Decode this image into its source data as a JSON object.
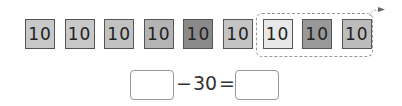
{
  "tiles": [
    {
      "label": "10",
      "color": "#c8c8c8"
    },
    {
      "label": "10",
      "color": "#c8c8c8"
    },
    {
      "label": "10",
      "color": "#c2c2c2"
    },
    {
      "label": "10",
      "color": "#b4b4b4"
    },
    {
      "label": "10",
      "color": "#8a8a8a"
    },
    {
      "label": "10",
      "color": "#c4c4c4"
    },
    {
      "label": "10",
      "color": "#e8e8e8"
    },
    {
      "label": "10",
      "color": "#999999"
    },
    {
      "label": "10",
      "color": "#bcbcbc"
    }
  ],
  "equation": {
    "left_blank": "",
    "operator": "−",
    "subtrahend": "30",
    "equals": "=",
    "right_blank": ""
  }
}
